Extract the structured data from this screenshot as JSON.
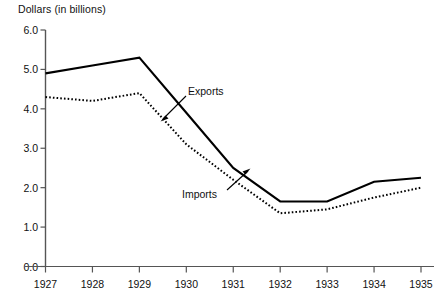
{
  "chart_data": {
    "type": "line",
    "title": "Dollars (in billions)",
    "xlabel": "",
    "ylabel": "Dollars (in billions)",
    "categories": [
      "1927",
      "1928",
      "1929",
      "1930",
      "1931",
      "1932",
      "1933",
      "1934",
      "1935"
    ],
    "x": [
      1927,
      1928,
      1929,
      1930,
      1931,
      1932,
      1933,
      1934,
      1935
    ],
    "ylim": [
      0.0,
      6.0
    ],
    "ytick_values": [
      0.0,
      1.0,
      2.0,
      3.0,
      4.0,
      5.0,
      6.0
    ],
    "ytick_labels": [
      "0.0",
      "1.0",
      "2.0",
      "3.0",
      "4.0",
      "5.0",
      "6.0"
    ],
    "grid": false,
    "legend_position": "inline-annotation",
    "series": [
      {
        "name": "Exports",
        "style": "solid",
        "color": "#000000",
        "values": [
          4.9,
          5.1,
          5.3,
          3.9,
          2.5,
          1.65,
          1.65,
          2.15,
          2.25
        ]
      },
      {
        "name": "Imports",
        "style": "dotted",
        "color": "#000000",
        "values": [
          4.3,
          4.2,
          4.4,
          3.1,
          2.2,
          1.35,
          1.45,
          1.75,
          2.0
        ]
      }
    ],
    "annotations": [
      {
        "text": "Exports",
        "points_to_series": "Exports",
        "at_x": 1930
      },
      {
        "text": "Imports",
        "points_to_series": "Imports",
        "at_x": 1931
      }
    ]
  },
  "axis": {
    "title": "Dollars (in billions)"
  }
}
